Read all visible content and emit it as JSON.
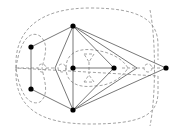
{
  "diagram": {
    "type": "planar-graph-with-dual",
    "colors": {
      "primal_edge": "#555555",
      "dual_edge": "#8a8a8a",
      "vertex": "#000000",
      "background": "#ffffff"
    },
    "vertices": [
      {
        "id": "A",
        "x": 73,
        "y": 26
      },
      {
        "id": "B",
        "x": 31,
        "y": 47
      },
      {
        "id": "C",
        "x": 31,
        "y": 89
      },
      {
        "id": "D",
        "x": 73,
        "y": 110
      },
      {
        "id": "E",
        "x": 73,
        "y": 68
      },
      {
        "id": "F",
        "x": 114,
        "y": 68
      },
      {
        "id": "G",
        "x": 166,
        "y": 68
      }
    ],
    "bend_points": [
      {
        "id": "P",
        "x": 55,
        "y": 68
      },
      {
        "id": "Q",
        "x": 137,
        "y": 68
      }
    ],
    "edges": [
      [
        "A",
        "B"
      ],
      [
        "B",
        "C"
      ],
      [
        "C",
        "D"
      ],
      [
        "A",
        "P"
      ],
      [
        "P",
        "D"
      ],
      [
        "A",
        "E"
      ],
      [
        "E",
        "D"
      ],
      [
        "E",
        "F"
      ],
      [
        "A",
        "F"
      ],
      [
        "D",
        "F"
      ],
      [
        "A",
        "Q"
      ],
      [
        "Q",
        "D"
      ],
      [
        "A",
        "G"
      ],
      [
        "D",
        "G"
      ]
    ],
    "dual_style": "dashed"
  }
}
